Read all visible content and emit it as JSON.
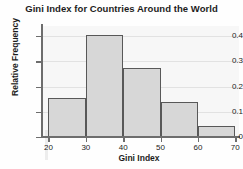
{
  "chart_data": {
    "type": "bar",
    "title": "Gini Index for Countries Around the World",
    "xlabel": "Gini Index",
    "ylabel": "Relative Frequency",
    "xlim": [
      18,
      71
    ],
    "ylim": [
      0,
      0.44
    ],
    "grid": true,
    "legend": null,
    "bin_edges": [
      20,
      30,
      40,
      50,
      60,
      70
    ],
    "categories": [
      "20-30",
      "30-40",
      "40-50",
      "50-60",
      "60-70"
    ],
    "values": [
      0.155,
      0.405,
      0.275,
      0.137,
      0.045
    ],
    "xticks": [
      20,
      30,
      40,
      50,
      60,
      70
    ],
    "xtick_labels": [
      "20",
      "30",
      "40",
      "50",
      "60",
      "70"
    ],
    "yticks": [
      0,
      0.1,
      0.2,
      0.3,
      0.4
    ],
    "ytick_labels": [
      "0",
      "0.1",
      "0.2",
      "0.3",
      "0.4"
    ],
    "colors": {
      "bar_fill": "#d7d7d7",
      "bar_edge": "#585858",
      "axis": "#6d6d6d",
      "grid": "#e2e2e2",
      "plot_background": "#f7f7f7",
      "text": "#1c1c1c"
    }
  }
}
